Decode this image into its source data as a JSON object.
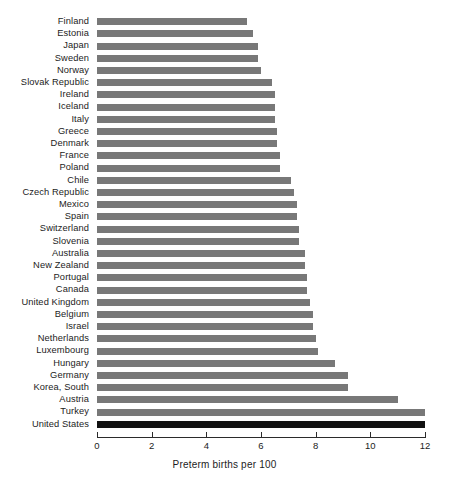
{
  "chart_data": {
    "type": "bar",
    "orientation": "horizontal",
    "title": "",
    "xlabel": "Preterm births per 100",
    "ylabel": "",
    "xlim": [
      0,
      12
    ],
    "xticks": [
      0,
      2,
      4,
      6,
      8,
      10,
      12
    ],
    "xtick_labels": [
      "0",
      "2",
      "4",
      "6",
      "8",
      "10",
      "12"
    ],
    "grid": false,
    "legend": "none",
    "bar_color": "#787878",
    "highlight_color": "#111111",
    "highlighted_category": "United States",
    "categories": [
      "Finland",
      "Estonia",
      "Japan",
      "Sweden",
      "Norway",
      "Slovak Republic",
      "Ireland",
      "Iceland",
      "Italy",
      "Greece",
      "Denmark",
      "France",
      "Poland",
      "Chile",
      "Czech Republic",
      "Mexico",
      "Spain",
      "Switzerland",
      "Slovenia",
      "Australia",
      "New Zealand",
      "Portugal",
      "Canada",
      "United Kingdom",
      "Belgium",
      "Israel",
      "Netherlands",
      "Luxembourg",
      "Hungary",
      "Germany",
      "Korea, South",
      "Austria",
      "Turkey",
      "United States"
    ],
    "values": [
      5.5,
      5.7,
      5.9,
      5.9,
      6.0,
      6.4,
      6.5,
      6.5,
      6.5,
      6.6,
      6.6,
      6.7,
      6.7,
      7.1,
      7.2,
      7.3,
      7.3,
      7.4,
      7.4,
      7.6,
      7.6,
      7.7,
      7.7,
      7.8,
      7.9,
      7.9,
      8.0,
      8.1,
      8.7,
      9.2,
      9.2,
      11.0,
      12.0,
      12.0
    ]
  }
}
